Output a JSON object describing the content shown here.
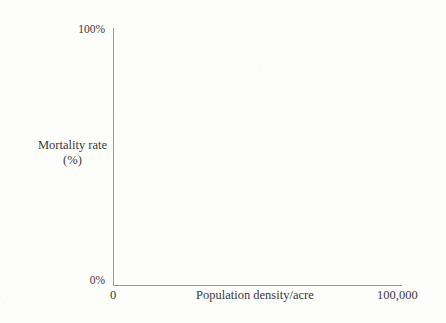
{
  "chart_data": {
    "type": "scatter",
    "title": "",
    "subtitle": "",
    "xlabel": "Population density/acre",
    "ylabel": "Mortality rate\n(%)",
    "ylabel_lines": [
      "Mortality rate",
      "(%)"
    ],
    "x_tick_labels": [
      "0",
      "100,000"
    ],
    "y_tick_labels": [
      "0%",
      "100%"
    ],
    "xlim": [
      0,
      100000
    ],
    "ylim": [
      0,
      100
    ],
    "grid": false,
    "legend": null,
    "series": [],
    "values": [],
    "annotations": [],
    "note": "Empty axes template: no plotted data points are drawn inside the axes."
  },
  "axes": {
    "x_label": "Population density/acre",
    "x_min_label": "0",
    "x_max_label": "100,000",
    "y_label_line1": "Mortality rate",
    "y_label_line2": "(%)",
    "y_min_label": "0%",
    "y_max_label": "100%"
  },
  "colors": {
    "background": "#fdfdfc",
    "axis_line": "#9a9a9a",
    "text": "#3b3b3b"
  }
}
